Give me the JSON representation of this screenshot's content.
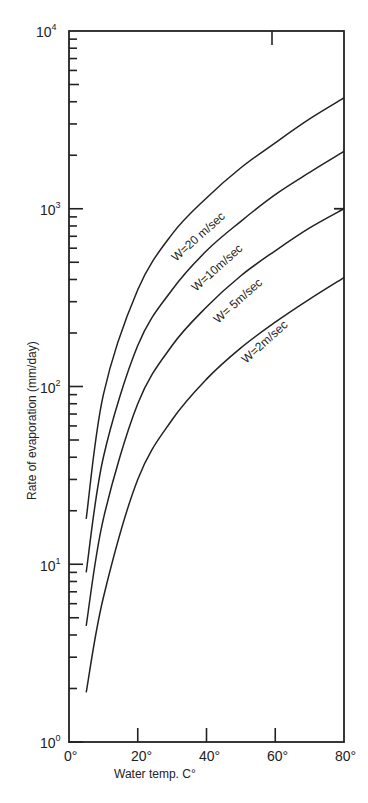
{
  "chart_data": {
    "type": "line",
    "title": "",
    "xlabel": "Water temp. C°",
    "ylabel": "Rate of evaporation (mm/day)",
    "xlim": [
      0,
      80
    ],
    "ylim": [
      1,
      10000
    ],
    "yscale": "log",
    "grid": false,
    "legend": "inline labels on curves",
    "x_ticks": [
      "0°",
      "20°",
      "40°",
      "60°",
      "80°"
    ],
    "y_ticks": [
      {
        "base": "10",
        "exp": "0"
      },
      {
        "base": "10",
        "exp": "1"
      },
      {
        "base": "10",
        "exp": "2"
      },
      {
        "base": "10",
        "exp": "3"
      },
      {
        "base": "10",
        "exp": "4"
      }
    ],
    "x": [
      5,
      10,
      20,
      30,
      40,
      50,
      60,
      70,
      80
    ],
    "series": [
      {
        "name": "W=20 m/sec",
        "values": [
          18,
          90,
          350,
          720,
          1150,
          1700,
          2350,
          3200,
          4200
        ]
      },
      {
        "name": "W=10m/sec",
        "values": [
          9,
          40,
          170,
          350,
          580,
          850,
          1200,
          1600,
          2100
        ]
      },
      {
        "name": "W= 5m/sec",
        "values": [
          4.5,
          18,
          80,
          170,
          280,
          420,
          580,
          780,
          1000
        ]
      },
      {
        "name": "W=2m/sec",
        "values": [
          1.9,
          6.5,
          30,
          65,
          110,
          165,
          230,
          310,
          410
        ]
      }
    ]
  },
  "labels": {
    "xlabel": "Water temp. C°",
    "ylabel": "Rate of evaporation (mm/day)",
    "series": [
      "W=20 m/sec",
      "W=10m/sec",
      "W= 5m/sec",
      "W=2m/sec"
    ],
    "x_ticks": [
      "0°",
      "20°",
      "40°",
      "60°",
      "80°"
    ],
    "y_base": "10",
    "y_exps": [
      "0",
      "1",
      "2",
      "3",
      "4"
    ]
  }
}
